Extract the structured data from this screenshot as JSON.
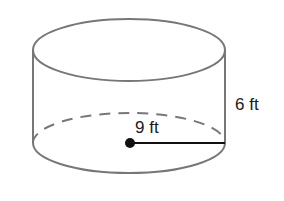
{
  "figure": {
    "shape": "cylinder",
    "labels": {
      "radius": "9 ft",
      "height": "6 ft"
    },
    "colors": {
      "outline": "#777777",
      "radius_line": "#111111",
      "text": "#1a1a1a"
    }
  }
}
